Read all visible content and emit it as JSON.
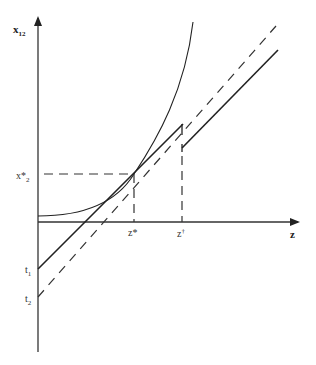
{
  "diagram": {
    "type": "economic-optimization-diagram",
    "axes": {
      "y_label": "x",
      "y_label_sub": "12",
      "x_label": "z"
    },
    "labels": {
      "x_star_base": "x*",
      "x_star_sub": "2",
      "z_star": "z*",
      "z_dagger_base": "z",
      "z_dagger_sup": "†",
      "t1_base": "t",
      "t1_sub": "1",
      "t2_base": "t",
      "t2_sub": "2"
    },
    "elements": [
      {
        "name": "convex-curve",
        "style": "solid",
        "description": "increasing convex curve starting slightly above z axis"
      },
      {
        "name": "tangent-line",
        "style": "solid",
        "intercept": "t1",
        "tangent_at": "z*"
      },
      {
        "name": "shifted-line",
        "style": "dashed",
        "intercept": "t2",
        "parallel_to": "tangent-line"
      },
      {
        "name": "upper-solid-segment",
        "style": "solid",
        "starts_at": "z†"
      },
      {
        "name": "x-star-guide",
        "style": "dashed",
        "orientation": "horizontal"
      },
      {
        "name": "z-star-guide",
        "style": "dashed",
        "orientation": "vertical"
      },
      {
        "name": "z-dagger-guide",
        "style": "dashed",
        "orientation": "vertical"
      }
    ],
    "colors": {
      "line": "#222222",
      "axis": "#333333",
      "background": "#ffffff"
    }
  }
}
